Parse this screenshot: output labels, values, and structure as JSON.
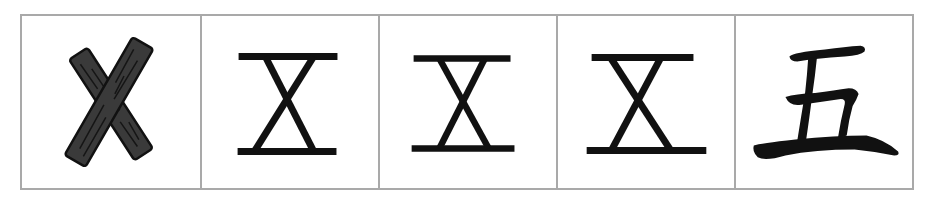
{
  "diagram": {
    "subject": "五",
    "frame_color": "#a9a9a9",
    "ink_color": "#111111",
    "wood_color": "#3a3a3a",
    "panels": [
      {
        "id": "sticks",
        "label": "crossed sticks",
        "glyph": ""
      },
      {
        "id": "form-1",
        "label": "ancient form 1",
        "glyph": ""
      },
      {
        "id": "form-2",
        "label": "ancient form 2",
        "glyph": ""
      },
      {
        "id": "form-3",
        "label": "ancient form 3",
        "glyph": ""
      },
      {
        "id": "modern",
        "label": "modern character",
        "glyph": "五"
      }
    ]
  }
}
